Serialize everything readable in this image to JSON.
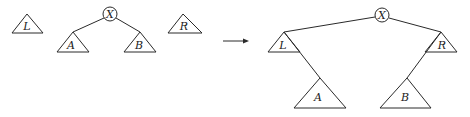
{
  "diagram": {
    "type": "tree-rotation",
    "before": {
      "root": "X",
      "root_children": [
        "A",
        "B"
      ],
      "separate_subtrees": [
        "L",
        "R"
      ]
    },
    "arrow": "→",
    "after": {
      "root": "X",
      "root_children": [
        "L",
        "R"
      ],
      "L_child": "A",
      "R_child": "B"
    }
  },
  "labels": {
    "L": "L",
    "X": "X",
    "A": "A",
    "B": "B",
    "R": "R"
  },
  "colors": {
    "line": "#2a2a2a",
    "background": "#ffffff"
  }
}
